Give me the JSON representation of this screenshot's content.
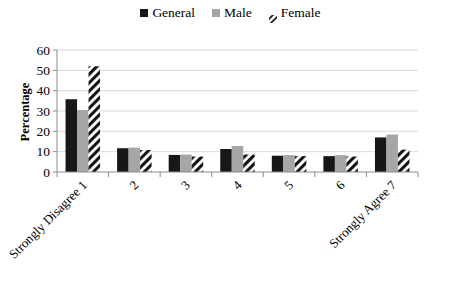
{
  "chart_data": {
    "type": "bar",
    "title": "",
    "xlabel": "",
    "ylabel": "Percentage",
    "ylim": [
      0,
      60
    ],
    "yticks": [
      0,
      10,
      20,
      30,
      40,
      50,
      60
    ],
    "grid": true,
    "legend_position": "top-center",
    "categories": [
      "Strongly Disagree 1",
      "2",
      "3",
      "4",
      "5",
      "6",
      "Strongly Agree 7"
    ],
    "series": [
      {
        "name": "General",
        "color": "#171717",
        "pattern": "solid",
        "values": [
          35.8,
          11.7,
          8.4,
          11.3,
          8.0,
          7.8,
          17.0
        ]
      },
      {
        "name": "Male",
        "color": "#a6a6a6",
        "pattern": "solid",
        "values": [
          30.5,
          12.0,
          8.6,
          12.8,
          8.3,
          8.3,
          18.4
        ]
      },
      {
        "name": "Female",
        "color": "#ffffff",
        "pattern": "diagonal-stripe",
        "values": [
          52.0,
          10.8,
          7.6,
          8.6,
          7.8,
          7.6,
          11.0
        ]
      }
    ]
  },
  "legend": {
    "items": [
      {
        "label": "General",
        "swatch": "solid-dark-square"
      },
      {
        "label": "Male",
        "swatch": "solid-gray-square"
      },
      {
        "label": "Female",
        "swatch": "striped-square"
      }
    ]
  },
  "axes": {
    "y_title": "Percentage",
    "y_ticks": [
      "0",
      "10",
      "20",
      "30",
      "40",
      "50",
      "60"
    ],
    "x_ticks": [
      "Strongly Disagree 1",
      "2",
      "3",
      "4",
      "5",
      "6",
      "Strongly Agree 7"
    ]
  },
  "caption": {
    "text": ""
  },
  "colors": {
    "general": "#171717",
    "male": "#a6a6a6",
    "female_stripe": "#1a1a1a",
    "axis": "#8c8c8c",
    "grid": "#d9d9d9"
  }
}
